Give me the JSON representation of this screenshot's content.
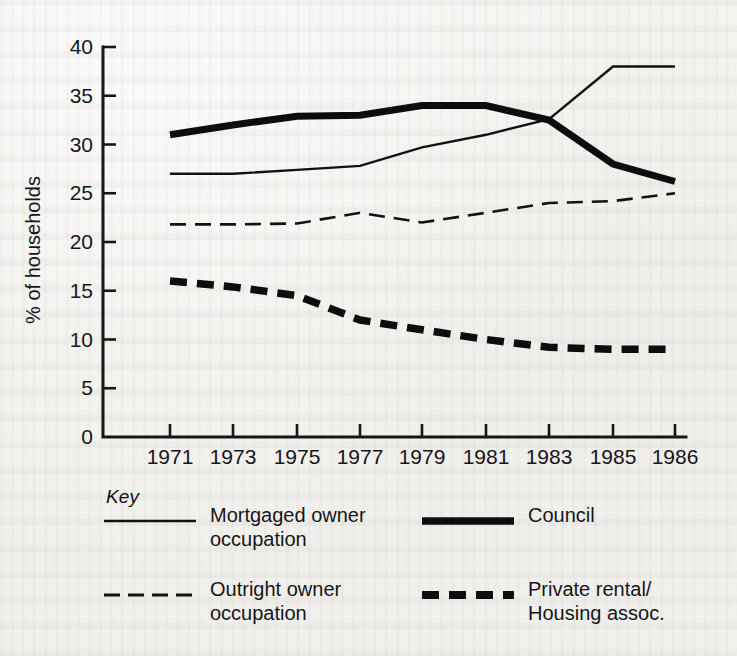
{
  "chart_data": {
    "type": "line",
    "title": "",
    "xlabel": "",
    "ylabel": "% of households",
    "x": [
      "1971",
      "1973",
      "1975",
      "1977",
      "1979",
      "1981",
      "1983",
      "1985",
      "1986"
    ],
    "xtick_labels": [
      "1971",
      "1973",
      "1975",
      "1977",
      "1979",
      "1981",
      "1983",
      "1985",
      "1986"
    ],
    "ytick_labels": [
      "0",
      "5",
      "10",
      "15",
      "20",
      "25",
      "30",
      "35",
      "40"
    ],
    "ylim": [
      0,
      40
    ],
    "ytick_step": 5,
    "grid": false,
    "legend_position": "below-plot",
    "legend_title": "Key",
    "series": [
      {
        "name": "Mortgaged owner occupation",
        "style": "thin-solid",
        "values": [
          27.0,
          27.0,
          27.4,
          27.8,
          29.7,
          31.0,
          32.6,
          38.0,
          38.0
        ]
      },
      {
        "name": "Council",
        "style": "thick-solid",
        "values": [
          31.0,
          32.0,
          32.9,
          33.0,
          34.0,
          34.0,
          32.5,
          28.0,
          26.2
        ]
      },
      {
        "name": "Outright owner occupation",
        "style": "thin-dashed",
        "values": [
          21.8,
          21.8,
          21.9,
          23.0,
          22.0,
          23.0,
          24.0,
          24.2,
          25.0
        ]
      },
      {
        "name": "Private rental/ Housing assoc.",
        "style": "thick-dashed",
        "values": [
          16.0,
          15.4,
          14.5,
          12.0,
          11.0,
          10.0,
          9.2,
          9.0,
          9.0
        ]
      }
    ]
  },
  "legend": {
    "title": "Key",
    "entries": [
      {
        "id": "mortgaged",
        "label": "Mortgaged owner\noccupation",
        "style": "thin-solid"
      },
      {
        "id": "council",
        "label": "Council",
        "style": "thick-solid"
      },
      {
        "id": "outright",
        "label": "Outright owner\noccupation",
        "style": "thin-dashed"
      },
      {
        "id": "private",
        "label": "Private rental/\nHousing assoc.",
        "style": "thick-dashed"
      }
    ]
  },
  "colors": {
    "ink": "#121214",
    "paper": "#f2f1ee"
  }
}
